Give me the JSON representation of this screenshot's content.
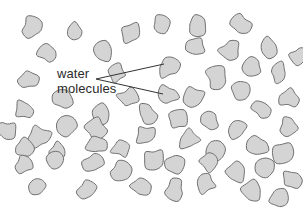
{
  "diagram": {
    "background_color": "#ffffff",
    "canvas": {
      "width": 303,
      "height": 212
    },
    "label": {
      "line1": "water",
      "line2": "molecules",
      "text_color": "#2b2b2b",
      "font_size_px": 13,
      "line1_x": 57,
      "line1_y": 78,
      "line2_x": 57,
      "line2_y": 93
    },
    "leader_lines": {
      "color": "#333333",
      "width_px": 1,
      "vertex": {
        "x": 96,
        "y": 79
      },
      "lines": [
        {
          "name": "upper-leader-line",
          "x1": 96,
          "y1": 79,
          "x2": 164,
          "y2": 64
        },
        {
          "name": "lower-leader-line",
          "x1": 96,
          "y1": 79,
          "x2": 163,
          "y2": 94
        }
      ]
    },
    "molecule_style": {
      "fill_color": "#d4d4d4",
      "stroke_color": "#6f6f6f",
      "stroke_width_px": 1
    },
    "molecule_count": 62,
    "molecules": [
      {
        "x": 32,
        "y": 27,
        "r": 10,
        "rot": 20,
        "seed": 1
      },
      {
        "x": 74,
        "y": 31,
        "r": 9,
        "rot": 140,
        "seed": 2
      },
      {
        "x": 131,
        "y": 33,
        "r": 10,
        "rot": 75,
        "seed": 3
      },
      {
        "x": 161,
        "y": 25,
        "r": 10,
        "rot": 200,
        "seed": 4
      },
      {
        "x": 196,
        "y": 27,
        "r": 10,
        "rot": 310,
        "seed": 5
      },
      {
        "x": 240,
        "y": 24,
        "r": 11,
        "rot": 45,
        "seed": 6
      },
      {
        "x": 48,
        "y": 53,
        "r": 10,
        "rot": 260,
        "seed": 7
      },
      {
        "x": 103,
        "y": 51,
        "r": 10,
        "rot": 15,
        "seed": 8
      },
      {
        "x": 196,
        "y": 47,
        "r": 10,
        "rot": 120,
        "seed": 9
      },
      {
        "x": 230,
        "y": 50,
        "r": 10,
        "rot": 225,
        "seed": 10
      },
      {
        "x": 268,
        "y": 47,
        "r": 10,
        "rot": 85,
        "seed": 11
      },
      {
        "x": 28,
        "y": 79,
        "r": 10,
        "rot": 170,
        "seed": 12
      },
      {
        "x": 168,
        "y": 67,
        "r": 11,
        "rot": 300,
        "seed": 13
      },
      {
        "x": 217,
        "y": 78,
        "r": 11,
        "rot": 30,
        "seed": 14
      },
      {
        "x": 279,
        "y": 73,
        "r": 10,
        "rot": 195,
        "seed": 15
      },
      {
        "x": 128,
        "y": 98,
        "r": 10,
        "rot": 60,
        "seed": 16
      },
      {
        "x": 168,
        "y": 95,
        "r": 10,
        "rot": 240,
        "seed": 17
      },
      {
        "x": 194,
        "y": 97,
        "r": 10,
        "rot": 110,
        "seed": 18
      },
      {
        "x": 240,
        "y": 89,
        "r": 10,
        "rot": 330,
        "seed": 19
      },
      {
        "x": 25,
        "y": 110,
        "r": 10,
        "rot": 10,
        "seed": 20
      },
      {
        "x": 100,
        "y": 113,
        "r": 10,
        "rot": 150,
        "seed": 21
      },
      {
        "x": 262,
        "y": 109,
        "r": 10,
        "rot": 275,
        "seed": 22
      },
      {
        "x": 67,
        "y": 125,
        "r": 10,
        "rot": 95,
        "seed": 23
      },
      {
        "x": 178,
        "y": 120,
        "r": 10,
        "rot": 215,
        "seed": 24
      },
      {
        "x": 210,
        "y": 121,
        "r": 10,
        "rot": 35,
        "seed": 25
      },
      {
        "x": 237,
        "y": 129,
        "r": 10,
        "rot": 160,
        "seed": 26
      },
      {
        "x": 289,
        "y": 126,
        "r": 10,
        "rot": 285,
        "seed": 27
      },
      {
        "x": 39,
        "y": 137,
        "r": 11,
        "rot": 70,
        "seed": 28
      },
      {
        "x": 96,
        "y": 129,
        "r": 10,
        "rot": 190,
        "seed": 29
      },
      {
        "x": 146,
        "y": 135,
        "r": 10,
        "rot": 320,
        "seed": 30
      },
      {
        "x": 23,
        "y": 148,
        "r": 10,
        "rot": 50,
        "seed": 31
      },
      {
        "x": 58,
        "y": 151,
        "r": 10,
        "rot": 175,
        "seed": 32
      },
      {
        "x": 96,
        "y": 145,
        "r": 10,
        "rot": 295,
        "seed": 33
      },
      {
        "x": 122,
        "y": 148,
        "r": 10,
        "rot": 25,
        "seed": 34
      },
      {
        "x": 189,
        "y": 140,
        "r": 10,
        "rot": 135,
        "seed": 35
      },
      {
        "x": 258,
        "y": 146,
        "r": 10,
        "rot": 250,
        "seed": 36
      },
      {
        "x": 283,
        "y": 153,
        "r": 10,
        "rot": 80,
        "seed": 37
      },
      {
        "x": 215,
        "y": 152,
        "r": 10,
        "rot": 205,
        "seed": 38
      },
      {
        "x": 24,
        "y": 164,
        "r": 10,
        "rot": 340,
        "seed": 39
      },
      {
        "x": 56,
        "y": 161,
        "r": 10,
        "rot": 65,
        "seed": 40
      },
      {
        "x": 94,
        "y": 163,
        "r": 10,
        "rot": 185,
        "seed": 41
      },
      {
        "x": 120,
        "y": 171,
        "r": 10,
        "rot": 305,
        "seed": 42
      },
      {
        "x": 154,
        "y": 159,
        "r": 10,
        "rot": 40,
        "seed": 43
      },
      {
        "x": 174,
        "y": 164,
        "r": 10,
        "rot": 155,
        "seed": 44
      },
      {
        "x": 209,
        "y": 161,
        "r": 10,
        "rot": 270,
        "seed": 45
      },
      {
        "x": 235,
        "y": 173,
        "r": 10,
        "rot": 100,
        "seed": 46
      },
      {
        "x": 266,
        "y": 170,
        "r": 10,
        "rot": 220,
        "seed": 47
      },
      {
        "x": 291,
        "y": 180,
        "r": 10,
        "rot": 5,
        "seed": 48
      },
      {
        "x": 38,
        "y": 186,
        "r": 10,
        "rot": 130,
        "seed": 49
      },
      {
        "x": 88,
        "y": 189,
        "r": 10,
        "rot": 255,
        "seed": 50
      },
      {
        "x": 140,
        "y": 186,
        "r": 10,
        "rot": 90,
        "seed": 51
      },
      {
        "x": 175,
        "y": 190,
        "r": 10,
        "rot": 210,
        "seed": 52
      },
      {
        "x": 206,
        "y": 183,
        "r": 10,
        "rot": 335,
        "seed": 53
      },
      {
        "x": 252,
        "y": 191,
        "r": 10,
        "rot": 55,
        "seed": 54
      },
      {
        "x": 279,
        "y": 199,
        "r": 10,
        "rot": 165,
        "seed": 55
      },
      {
        "x": 147,
        "y": 114,
        "r": 10,
        "rot": 280,
        "seed": 56
      },
      {
        "x": 63,
        "y": 99,
        "r": 9,
        "rot": 115,
        "seed": 57
      },
      {
        "x": 289,
        "y": 98,
        "r": 10,
        "rot": 235,
        "seed": 58
      },
      {
        "x": 253,
        "y": 67,
        "r": 10,
        "rot": 350,
        "seed": 59
      },
      {
        "x": 117,
        "y": 73,
        "r": 9,
        "rot": 105,
        "seed": 60
      },
      {
        "x": 7,
        "y": 130,
        "r": 9,
        "rot": 230,
        "seed": 61
      },
      {
        "x": 299,
        "y": 56,
        "r": 9,
        "rot": 145,
        "seed": 62
      }
    ]
  }
}
